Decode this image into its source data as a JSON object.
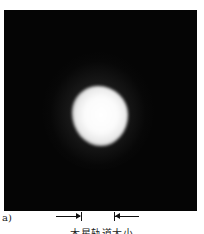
{
  "figure": {
    "panel_label": "a)",
    "image_description": "Dark field image with a bright white glowing blob near center",
    "scale_caption": "木星轨道大小",
    "colors": {
      "background": "#050505",
      "blob": "#ffffff",
      "page": "#ffffff"
    }
  }
}
